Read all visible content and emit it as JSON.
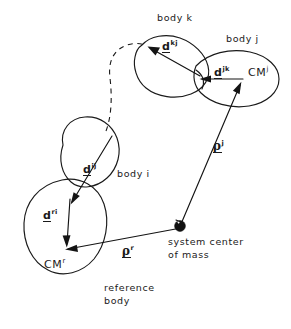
{
  "figure": {
    "domain": "technical-line-diagram",
    "background_color": "#ffffff",
    "ink_color": "#1a1a1a"
  },
  "body_labels": {
    "body_k": "body k",
    "body_j": "body j",
    "body_i": "body i",
    "reference_body_line1": "reference",
    "reference_body_line2": "body"
  },
  "point_labels": {
    "cm_j_base": "CM",
    "cm_j_sup": "j",
    "cm_r_base": "CM",
    "cm_r_sup": "r",
    "system_cm_line1": "system center",
    "system_cm_line2": "of mass"
  },
  "vectors": [
    {
      "id": "d-kj",
      "base": "d",
      "superscript": "kj",
      "description": "vector inside body k from the k-j joint toward the k-body hinge point"
    },
    {
      "id": "d-jk",
      "base": "d",
      "superscript": "jk",
      "description": "vector inside body j from CM-j toward the k-j joint"
    },
    {
      "id": "d-ij",
      "base": "d",
      "superscript": "ij",
      "description": "vector inside body i from its upper joint to the reference-body joint"
    },
    {
      "id": "d-ri",
      "base": "d",
      "superscript": "ri",
      "description": "vector inside the reference body from the i-joint down to CM-r"
    },
    {
      "id": "rho-j",
      "base": "ρ",
      "superscript": "j",
      "description": "position vector from the system center of mass to CM of body j"
    },
    {
      "id": "rho-r",
      "base": "ρ",
      "superscript": "r",
      "description": "position vector from the system center of mass to CM of the reference body"
    }
  ],
  "vector_label_text": {
    "d_kj_base": "d",
    "d_kj_sup": "kj",
    "d_jk_base": "d",
    "d_jk_sup": "jk",
    "d_ij_base": "d",
    "d_ij_sup": "ij",
    "d_ri_base": "d",
    "d_ri_sup": "ri",
    "rho_j_base": "ρ",
    "rho_j_sup": "j",
    "rho_r_base": "ρ",
    "rho_r_sup": "r"
  }
}
